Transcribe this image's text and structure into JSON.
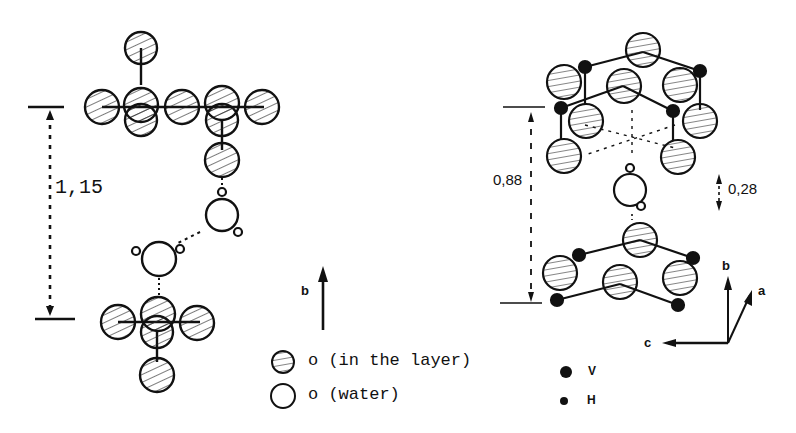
{
  "left_structure": {
    "spacing_label": "1,15",
    "axis_label": "b"
  },
  "right_structure": {
    "spacing_label": "0,88",
    "offset_label": "0,28",
    "axes": {
      "b": "b",
      "a": "a",
      "c": "c"
    }
  },
  "legend": {
    "items": [
      {
        "symbol": "hatched-circle",
        "label": "o (in the layer)"
      },
      {
        "symbol": "open-circle",
        "label": "o (water)"
      },
      {
        "symbol": "large-black-dot",
        "label": "V"
      },
      {
        "symbol": "small-black-dot",
        "label": "H"
      }
    ]
  },
  "colors": {
    "ink": "#111111",
    "paper": "#ffffff"
  }
}
